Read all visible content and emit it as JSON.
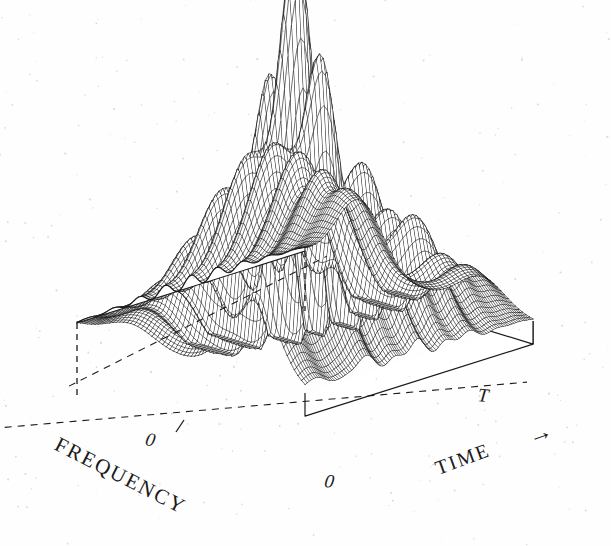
{
  "figure": {
    "kind": "3d-wireframe-surface-plot",
    "background_color": "#fefefe",
    "line_color": "#1a1a1a",
    "fill_color": "#ffffff"
  },
  "axes": {
    "frequency": {
      "label": "FREQUENCY",
      "origin_tick": "0",
      "rotation_deg": 27
    },
    "time": {
      "label": "TIME",
      "arrow": "→",
      "start_tick": "0",
      "end_tick": "T",
      "rotation_deg": -20
    }
  },
  "chart_data": {
    "type": "surface",
    "title": "",
    "xlabel": "TIME",
    "ylabel": "FREQUENCY",
    "zlabel": "",
    "xlim": [
      0,
      1
    ],
    "ylim": [
      -1,
      1
    ],
    "zlim": [
      0,
      1
    ],
    "xticks": [
      "0",
      "T"
    ],
    "yticks": [
      "0"
    ],
    "grid": false,
    "legend": null,
    "projection": {
      "azimuth_deg": -52,
      "elevation_deg": 26,
      "mesh_nx": 108,
      "mesh_ny": 64
    },
    "components": [
      {
        "name": "main-peak",
        "kind": "gaussian",
        "amplitude": 1.0,
        "center_x": 0.5,
        "center_y": 0.08,
        "sigma_x": 0.115,
        "sigma_y": 0.125
      },
      {
        "name": "left-ridge",
        "kind": "ridge",
        "amplitude": 0.47,
        "center_y": -0.55,
        "sigma_y": 0.2,
        "center_x": 0.36,
        "sigma_x": 0.38
      },
      {
        "name": "right-ridge",
        "kind": "ridge",
        "amplitude": 0.42,
        "center_y": 0.52,
        "sigma_y": 0.2,
        "center_x": 0.66,
        "sigma_x": 0.34
      },
      {
        "name": "interference-cross-terms",
        "kind": "oscillatory",
        "amplitude": 0.34,
        "center_x": 0.5,
        "center_y": 0.02,
        "sigma_x": 0.2,
        "sigma_y": 0.42,
        "frequency": 17.5,
        "phase": 0.0
      },
      {
        "name": "left-ripple-band",
        "kind": "oscillatory",
        "amplitude": 0.1,
        "center_x": 0.3,
        "center_y": -0.5,
        "sigma_x": 0.3,
        "sigma_y": 0.3,
        "frequency": 9.0,
        "phase": 1.2
      }
    ]
  }
}
